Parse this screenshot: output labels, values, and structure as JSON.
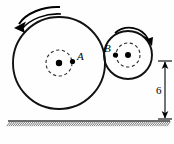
{
  "figure": {
    "type": "mechanics-diagram",
    "background_color": "#fefefe",
    "ink_color": "#111111",
    "width": 174,
    "height": 144
  },
  "wheels": [
    {
      "id": "wheel-a",
      "label": "A",
      "label_position": "right-of-hub",
      "center_x": 59,
      "center_y": 63,
      "radius": 46,
      "hub_dashed_radius": 13,
      "hub_dot_radius": 3.2,
      "rotation_label": "counterclockwise",
      "rotation_arrow_direction": "left"
    },
    {
      "id": "wheel-b",
      "label": "B",
      "label_position": "left-of-hub",
      "center_x": 128,
      "center_y": 55,
      "radius": 24,
      "hub_dashed_radius": 12,
      "hub_dot_radius": 3.0,
      "rotation_label": "clockwise",
      "rotation_arrow_direction": "right"
    }
  ],
  "dimension": {
    "id": "dimension-6",
    "value": "6",
    "label_x": 158,
    "label_y": 90,
    "line_x": 165,
    "top_y": 61,
    "bottom_y": 119,
    "tick_half_width": 7,
    "orientation": "vertical",
    "arrowheads": "both-ends"
  },
  "ground": {
    "id": "ground-surface",
    "line_y": 121,
    "x_start": 8,
    "x_end": 170,
    "hatching": "diagonal",
    "hatch_count": 78,
    "hatch_color": "#555555"
  },
  "accessibility": {
    "alt": "Diagram: large disk A in contact with smaller disk B; A rotates counterclockwise, B rotates clockwise; a dimension of 6 measures from disk B level down to the hatched ground."
  }
}
